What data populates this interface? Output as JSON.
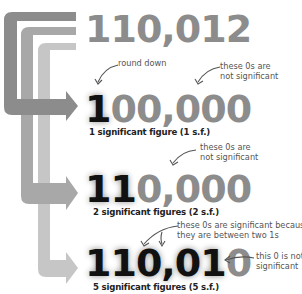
{
  "diagram": {
    "colors": {
      "arrow_1": "#8c8c8c",
      "arrow_2": "#a8a8a8",
      "arrow_3": "#c6c6c6",
      "significant_digit": "#111111",
      "non_significant_digit": "#8c8c8c",
      "note_text": "#555555"
    },
    "source_number": {
      "text": "110,012"
    },
    "rows": [
      {
        "id": "1sf",
        "significant_part": "1",
        "non_significant_part": "00,000",
        "caption": "1 significant figure (1 s.f.)",
        "notes": [
          {
            "id": "round-down",
            "text": "round down"
          },
          {
            "id": "zeros-not-significant",
            "line1": "these 0s are",
            "line2": "not significant"
          }
        ]
      },
      {
        "id": "2sf",
        "significant_part": "11",
        "non_significant_part": "0,000",
        "caption": "2 significant figures (2 s.f.)",
        "notes": [
          {
            "id": "zeros-not-significant",
            "line1": "these 0s are",
            "line2": "not significant"
          }
        ]
      },
      {
        "id": "5sf",
        "significant_part": "110,01",
        "non_significant_part": "0",
        "caption": "5 significant figures (5 s.f.)",
        "notes": [
          {
            "id": "zeros-significant",
            "line1": "these 0s are significant because",
            "line2": "they are between two 1s"
          },
          {
            "id": "last-zero-not-significant",
            "line1": "this 0 is not",
            "line2": "significant"
          }
        ]
      }
    ]
  }
}
